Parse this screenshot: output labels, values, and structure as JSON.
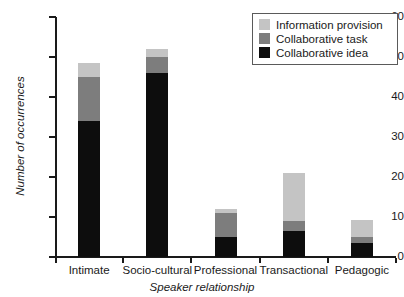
{
  "chart_data": {
    "type": "bar",
    "stacked": true,
    "title": "",
    "xlabel": "Speaker relationship",
    "ylabel": "Number of occurrences",
    "categories": [
      "Intimate",
      "Socio-cultural",
      "Professional",
      "Transactional",
      "Pedagogic"
    ],
    "series": [
      {
        "name": "Collaborative idea",
        "color": "#0d0d0d",
        "values": [
          34,
          46,
          5,
          6.5,
          3.5
        ]
      },
      {
        "name": "Collaborative task",
        "color": "#7d7d7d",
        "values": [
          11,
          4,
          6,
          2.5,
          1.5
        ]
      },
      {
        "name": "Information provision",
        "color": "#c4c4c4",
        "values": [
          3.5,
          2,
          1,
          12,
          4.3
        ]
      }
    ],
    "totals": [
      48.5,
      52,
      12,
      21,
      9.3
    ],
    "ylim": [
      0,
      60
    ],
    "yticks": [
      0,
      10,
      20,
      30,
      40,
      50,
      60
    ],
    "ytick_labels": [
      "0",
      "10",
      "20",
      "30",
      "40",
      "50",
      "60"
    ],
    "grid": false,
    "legend_position": "top-right",
    "legend_entries": [
      {
        "label": "Information provision",
        "color": "#c4c4c4"
      },
      {
        "label": "Collaborative task",
        "color": "#7d7d7d"
      },
      {
        "label": "Collaborative idea",
        "color": "#0d0d0d"
      }
    ]
  }
}
